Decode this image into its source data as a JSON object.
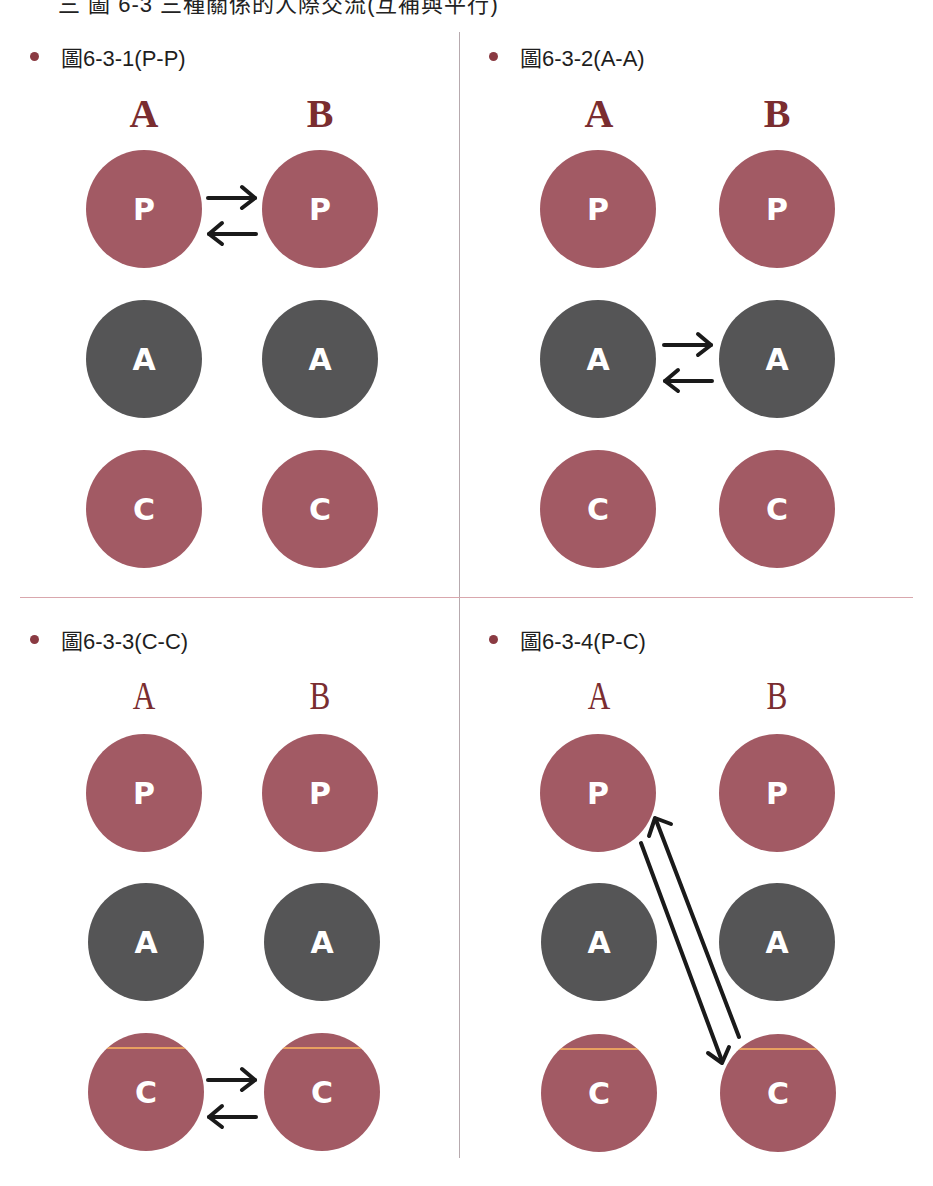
{
  "page": {
    "top_title": "三 圖 6-3 三種關係的人際交流(互補與平行)"
  },
  "colors": {
    "parent_child_circle": "#a25a64",
    "adult_circle": "#555556",
    "column_label": "#7a2d30",
    "bullet": "#8a3a42",
    "arrow": "#1a1a1a",
    "stripe": "#e8a060"
  },
  "panels": [
    {
      "title": "圖6-3-1(P-P)",
      "col_a": "A",
      "col_b": "B",
      "rows": [
        {
          "a": "P",
          "b": "P"
        },
        {
          "a": "A",
          "b": "A"
        },
        {
          "a": "C",
          "b": "C"
        }
      ],
      "transaction": "P-P"
    },
    {
      "title": "圖6-3-2(A-A)",
      "col_a": "A",
      "col_b": "B",
      "rows": [
        {
          "a": "P",
          "b": "P"
        },
        {
          "a": "A",
          "b": "A"
        },
        {
          "a": "C",
          "b": "C"
        }
      ],
      "transaction": "A-A"
    },
    {
      "title": "圖6-3-3(C-C)",
      "col_a": "A",
      "col_b": "B",
      "rows": [
        {
          "a": "P",
          "b": "P"
        },
        {
          "a": "A",
          "b": "A"
        },
        {
          "a": "C",
          "b": "C"
        }
      ],
      "transaction": "C-C"
    },
    {
      "title": "圖6-3-4(P-C)",
      "col_a": "A",
      "col_b": "B",
      "rows": [
        {
          "a": "P",
          "b": "P"
        },
        {
          "a": "A",
          "b": "A"
        },
        {
          "a": "C",
          "b": "C"
        }
      ],
      "transaction": "P-C"
    }
  ]
}
